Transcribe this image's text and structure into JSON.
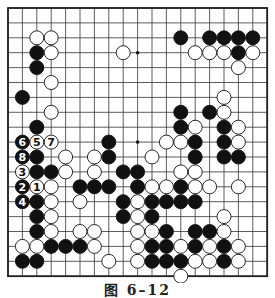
{
  "diagram": {
    "type": "go-board",
    "size": 19,
    "caption": "图 6–12",
    "colors": {
      "line": "#333333",
      "black_stone": "#111111",
      "white_stone": "#ffffff",
      "border": "#222222",
      "label_on_black": "#ffffff",
      "label_on_white": "#111111"
    },
    "star_points_visible": [
      [
        3,
        9
      ],
      [
        9,
        9
      ]
    ],
    "black_stones": [
      [
        2,
        12
      ],
      [
        2,
        14
      ],
      [
        2,
        15
      ],
      [
        2,
        16
      ],
      [
        2,
        17
      ],
      [
        3,
        2
      ],
      [
        3,
        16
      ],
      [
        4,
        2
      ],
      [
        6,
        1
      ],
      [
        7,
        12
      ],
      [
        7,
        14
      ],
      [
        8,
        2
      ],
      [
        8,
        12
      ],
      [
        8,
        15
      ],
      [
        9,
        7
      ],
      [
        9,
        13
      ],
      [
        9,
        15
      ],
      [
        10,
        2
      ],
      [
        10,
        7
      ],
      [
        10,
        13
      ],
      [
        10,
        15
      ],
      [
        10,
        16
      ],
      [
        11,
        2
      ],
      [
        11,
        3
      ],
      [
        11,
        8
      ],
      [
        11,
        9
      ],
      [
        12,
        5
      ],
      [
        12,
        6
      ],
      [
        12,
        7
      ],
      [
        12,
        9
      ],
      [
        12,
        12
      ],
      [
        13,
        2
      ],
      [
        13,
        8
      ],
      [
        13,
        10
      ],
      [
        13,
        11
      ],
      [
        13,
        12
      ],
      [
        13,
        13
      ],
      [
        14,
        2
      ],
      [
        14,
        8
      ],
      [
        14,
        10
      ],
      [
        15,
        2
      ],
      [
        15,
        11
      ],
      [
        15,
        13
      ],
      [
        15,
        14
      ],
      [
        16,
        3
      ],
      [
        16,
        4
      ],
      [
        16,
        5
      ],
      [
        16,
        10
      ],
      [
        16,
        11
      ],
      [
        16,
        13
      ],
      [
        16,
        15
      ],
      [
        17,
        1
      ],
      [
        17,
        2
      ],
      [
        17,
        10
      ],
      [
        17,
        11
      ],
      [
        17,
        12
      ],
      [
        17,
        15
      ]
    ],
    "white_stones": [
      [
        2,
        2
      ],
      [
        2,
        3
      ],
      [
        3,
        3
      ],
      [
        3,
        8
      ],
      [
        3,
        13
      ],
      [
        3,
        14
      ],
      [
        3,
        15
      ],
      [
        3,
        17
      ],
      [
        4,
        16
      ],
      [
        5,
        3
      ],
      [
        6,
        15
      ],
      [
        7,
        3
      ],
      [
        7,
        15
      ],
      [
        8,
        13
      ],
      [
        8,
        16
      ],
      [
        9,
        11
      ],
      [
        9,
        12
      ],
      [
        9,
        16
      ],
      [
        10,
        4
      ],
      [
        10,
        6
      ],
      [
        10,
        10
      ],
      [
        11,
        4
      ],
      [
        11,
        6
      ],
      [
        11,
        12
      ],
      [
        11,
        13
      ],
      [
        12,
        3
      ],
      [
        12,
        10
      ],
      [
        12,
        11
      ],
      [
        12,
        13
      ],
      [
        12,
        14
      ],
      [
        12,
        16
      ],
      [
        13,
        3
      ],
      [
        13,
        5
      ],
      [
        13,
        9
      ],
      [
        14,
        3
      ],
      [
        14,
        9
      ],
      [
        14,
        15
      ],
      [
        15,
        3
      ],
      [
        15,
        5
      ],
      [
        15,
        6
      ],
      [
        15,
        9
      ],
      [
        15,
        10
      ],
      [
        15,
        15
      ],
      [
        16,
        1
      ],
      [
        16,
        2
      ],
      [
        16,
        6
      ],
      [
        16,
        9
      ],
      [
        16,
        12
      ],
      [
        16,
        14
      ],
      [
        16,
        16
      ],
      [
        17,
        7
      ],
      [
        17,
        9
      ],
      [
        17,
        13
      ],
      [
        17,
        14
      ],
      [
        17,
        16
      ],
      [
        18,
        12
      ]
    ],
    "numbered_moves": [
      {
        "n": "1",
        "color": "white",
        "row": 12,
        "col": 2
      },
      {
        "n": "2",
        "color": "black",
        "row": 12,
        "col": 1
      },
      {
        "n": "3",
        "color": "white",
        "row": 11,
        "col": 1
      },
      {
        "n": "4",
        "color": "black",
        "row": 13,
        "col": 1
      },
      {
        "n": "5",
        "color": "white",
        "row": 9,
        "col": 2
      },
      {
        "n": "6",
        "color": "black",
        "row": 9,
        "col": 1
      },
      {
        "n": "7",
        "color": "white",
        "row": 9,
        "col": 3
      },
      {
        "n": "8",
        "color": "black",
        "row": 10,
        "col": 1
      }
    ]
  }
}
